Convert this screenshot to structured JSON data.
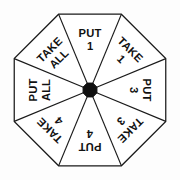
{
  "wheel": {
    "shape": "octagon",
    "sector_count": 8,
    "center": {
      "x": 90,
      "y": 90
    },
    "outer_radius": 82,
    "hub_radius": 7.5,
    "colors": {
      "background": "#fdfdfd",
      "face": "#ffffff",
      "outline": "#1a1a1a",
      "spoke": "#1a1a1a",
      "hub": "#101010",
      "text": "#111111"
    },
    "sectors": [
      {
        "id": "sector-put-1",
        "position": "top",
        "angle_deg": 0,
        "action": "PUT",
        "amount": "1",
        "lines": [
          "PUT",
          "1"
        ]
      },
      {
        "id": "sector-take-1",
        "position": "top-right",
        "angle_deg": 45,
        "action": "TAKE",
        "amount": "1",
        "lines": [
          "TAKE",
          "1"
        ]
      },
      {
        "id": "sector-put-3",
        "position": "right",
        "angle_deg": 90,
        "action": "PUT",
        "amount": "3",
        "lines": [
          "PUT",
          "3"
        ]
      },
      {
        "id": "sector-take-3",
        "position": "bottom-right",
        "angle_deg": 135,
        "action": "TAKE",
        "amount": "3",
        "lines": [
          "TAKE",
          "3"
        ]
      },
      {
        "id": "sector-put-4",
        "position": "bottom",
        "angle_deg": 180,
        "action": "PUT",
        "amount": "4",
        "lines": [
          "PUT",
          "4"
        ]
      },
      {
        "id": "sector-take-4",
        "position": "bottom-left",
        "angle_deg": 225,
        "action": "TAKE",
        "amount": "4",
        "lines": [
          "TAKE",
          "4"
        ]
      },
      {
        "id": "sector-put-all",
        "position": "left",
        "angle_deg": 270,
        "action": "PUT",
        "amount": "ALL",
        "lines": [
          "PUT",
          "ALL"
        ]
      },
      {
        "id": "sector-take-all",
        "position": "top-left",
        "angle_deg": 315,
        "action": "TAKE",
        "amount": "ALL",
        "lines": [
          "TAKE",
          "ALL"
        ]
      }
    ]
  }
}
